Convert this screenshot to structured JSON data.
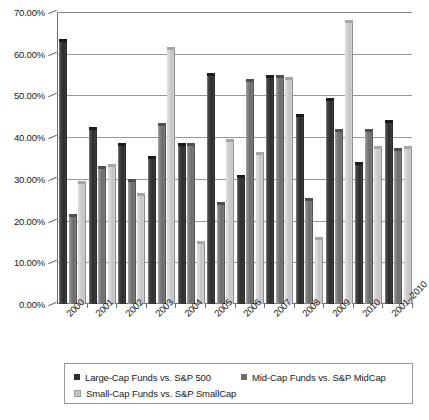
{
  "chart_data": {
    "type": "bar",
    "title": "",
    "xlabel": "",
    "ylabel": "",
    "ylim": [
      0,
      0.7
    ],
    "grid": true,
    "legend_position": "bottom",
    "categories": [
      "2000",
      "2001",
      "2002",
      "2003",
      "2004",
      "2005",
      "2006",
      "2007",
      "2008",
      "2009",
      "2010",
      "2001–2010"
    ],
    "ytick_labels": [
      "0.00%",
      "10.00%",
      "20.00%",
      "30.00%",
      "40.00%",
      "50.00%",
      "60.00%",
      "70.00%"
    ],
    "ytick_values": [
      0,
      10,
      20,
      30,
      40,
      50,
      60,
      70
    ],
    "series": [
      {
        "name": "Large-Cap Funds vs. S&P 500",
        "color": "#2e2e2e",
        "values": [
          63.5,
          42.5,
          38.5,
          35.5,
          38.5,
          55.5,
          31.0,
          55.0,
          45.5,
          49.5,
          34.0,
          44.0
        ]
      },
      {
        "name": "Mid-Cap Funds vs. S&P MidCap",
        "color": "#6d6d6d",
        "values": [
          21.5,
          33.0,
          30.0,
          43.5,
          38.5,
          24.5,
          54.0,
          55.0,
          25.5,
          42.0,
          42.0,
          37.5
        ]
      },
      {
        "name": "Small-Cap Funds vs. S&P SmallCap",
        "color": "#c4c4c4",
        "values": [
          29.5,
          33.5,
          26.5,
          61.5,
          15.0,
          39.5,
          36.5,
          54.5,
          16.0,
          68.0,
          38.0,
          38.0
        ]
      }
    ]
  },
  "legend": {
    "items": [
      {
        "label": "Large-Cap Funds vs. S&P 500"
      },
      {
        "label": "Mid-Cap Funds vs. S&P MidCap"
      },
      {
        "label": "Small-Cap Funds vs. S&P SmallCap"
      }
    ]
  }
}
